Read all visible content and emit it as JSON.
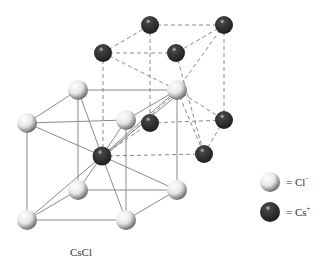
{
  "title": "CsCl",
  "legend": [
    {
      "symbol": "white-sphere",
      "label": "= Cl",
      "sup": "−",
      "ion": "Cl-"
    },
    {
      "symbol": "dark-sphere",
      "label": "= Cs",
      "sup": "+",
      "ion": "Cs+"
    }
  ],
  "colors": {
    "cl": "#f2f2f2",
    "cs": "#2e2e2e",
    "line": "#888888"
  },
  "structure": {
    "type": "body-centered cubic (CsCl)",
    "cl_positions": [
      [
        78,
        90
      ],
      [
        27,
        123
      ],
      [
        126,
        120
      ],
      [
        177,
        90
      ],
      [
        78,
        190
      ],
      [
        27,
        220
      ],
      [
        126,
        220
      ],
      [
        177,
        190
      ]
    ],
    "cs_positions": [
      [
        102,
        156
      ],
      [
        103,
        53
      ],
      [
        150,
        25
      ],
      [
        224,
        25
      ],
      [
        176,
        53
      ],
      [
        150,
        123
      ],
      [
        224,
        120
      ],
      [
        204,
        154
      ]
    ]
  }
}
